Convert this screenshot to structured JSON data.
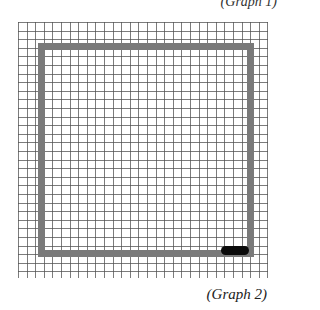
{
  "header": {
    "cut_text": "(Graph 1)"
  },
  "figure": {
    "grid": {
      "columns": 29,
      "rows": 30,
      "line_color": "#505050"
    },
    "square_outline": {
      "color": "#7a7a7a"
    },
    "marker": {
      "color": "#0a0a0a",
      "description": "black stroke at bottom-right corner of square"
    }
  },
  "caption": "(Graph 2)"
}
